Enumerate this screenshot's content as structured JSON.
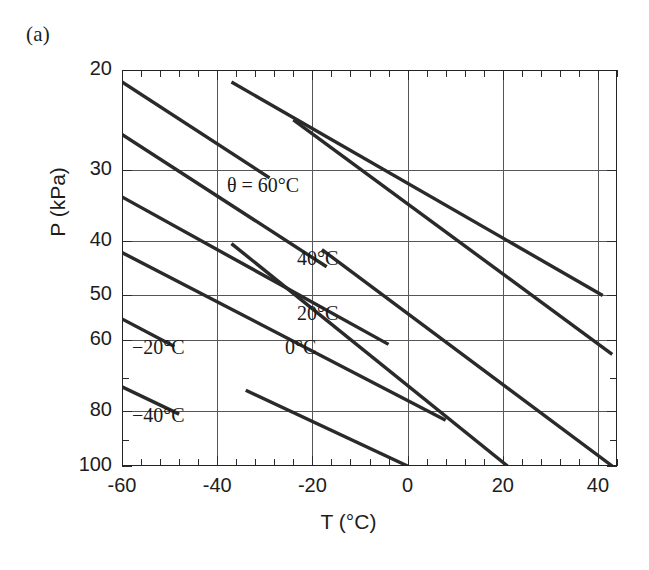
{
  "panel": {
    "label": "(a)"
  },
  "axes": {
    "xlabel": "T (°C)",
    "ylabel": "P (kPa)",
    "x_ticklabels": [
      "-60",
      "-40",
      "-20",
      "0",
      "20",
      "40"
    ],
    "x_tickvalues": [
      -60,
      -40,
      -20,
      0,
      20,
      40
    ],
    "y_ticklabels": [
      "20",
      "30",
      "40",
      "50",
      "60",
      "80",
      "100"
    ],
    "y_tickvalues": [
      20,
      30,
      40,
      50,
      60,
      80,
      100
    ],
    "x_minor_count_per_interval": 4,
    "xlim": [
      -60,
      44
    ],
    "ylim": [
      20,
      100
    ],
    "y_scale": "log",
    "y_inverted": true,
    "grid": true,
    "grid_color": "#55555a",
    "frame_color": "#232323",
    "line_color": "#2a2a2a"
  },
  "series_labels": {
    "theta_60": "θ = 60°C",
    "theta_40": "40°C",
    "theta_20": "20°C",
    "theta_0": "0°C",
    "theta_m20": "−20°C",
    "theta_m40": "−40°C"
  },
  "chart_data": {
    "type": "line",
    "title": "",
    "xlabel": "T (°C)",
    "ylabel": "P (kPa)",
    "xlim": [
      -60,
      44
    ],
    "ylim": [
      20,
      100
    ],
    "y_scale": "log",
    "y_inverted": true,
    "grid": true,
    "legend": "inline-annotations",
    "x_ticks": [
      -60,
      -40,
      -20,
      0,
      20,
      40
    ],
    "y_ticks": [
      20,
      30,
      40,
      50,
      60,
      80,
      100
    ],
    "series": [
      {
        "name": "θ = 60°C",
        "x": [
          -60,
          -29
        ],
        "y": [
          21.0,
          31.0
        ]
      },
      {
        "name": "40°C",
        "x": [
          -60,
          -17
        ],
        "y": [
          26.0,
          44.5
        ]
      },
      {
        "name": "20°C",
        "x": [
          -60,
          -4
        ],
        "y": [
          33.5,
          61.0
        ]
      },
      {
        "name": "0°C",
        "x": [
          -60,
          8
        ],
        "y": [
          42.0,
          83.0
        ]
      },
      {
        "name": "−20°C",
        "x": [
          -60,
          -49
        ],
        "y": [
          55.0,
          61.5
        ]
      },
      {
        "name": "−40°C",
        "x": [
          -60,
          -48
        ],
        "y": [
          72.5,
          81.0
        ]
      },
      {
        "name": "−20°C-cont",
        "x": [
          -37,
          21
        ],
        "y": [
          40.5,
          100.0
        ]
      },
      {
        "name": "−40°C-cont",
        "x": [
          -18,
          43
        ],
        "y": [
          41.5,
          100.0
        ]
      },
      {
        "name": "upper-cont-a",
        "x": [
          -37,
          41
        ],
        "y": [
          21.0,
          50.0
        ]
      },
      {
        "name": "upper-cont-b",
        "x": [
          -24,
          43
        ],
        "y": [
          24.5,
          63.5
        ]
      },
      {
        "name": "upper-cont-c",
        "x": [
          -34,
          0
        ],
        "y": [
          73.5,
          100.0
        ]
      }
    ]
  }
}
